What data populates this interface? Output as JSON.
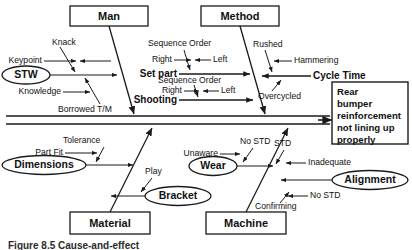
{
  "figure": {
    "type": "fishbone-ishikawa-cause-and-effect-diagram",
    "caption": "Figure 8.5  Cause-and-effect"
  },
  "effect": {
    "label": "Rear bumper reinforcement not lining up properly",
    "lines": [
      "Rear",
      "bumper",
      "reinforcement",
      "not lining up",
      "properly"
    ]
  },
  "categories": [
    {
      "id": "man",
      "label": "Man",
      "position": "top-left"
    },
    {
      "id": "method",
      "label": "Method",
      "position": "top-right"
    },
    {
      "id": "material",
      "label": "Material",
      "position": "bottom-left"
    },
    {
      "id": "machine",
      "label": "Machine",
      "position": "bottom-right"
    }
  ],
  "ovals": [
    {
      "id": "stw",
      "label": "STW"
    },
    {
      "id": "dimensions",
      "label": "Dimensions"
    },
    {
      "id": "bracket",
      "label": "Bracket"
    },
    {
      "id": "wear",
      "label": "Wear"
    },
    {
      "id": "alignment",
      "label": "Alignment"
    }
  ],
  "branches": {
    "man": {
      "name": "Man",
      "causes": [
        {
          "label": "Knack",
          "kind": "minor"
        },
        {
          "label": "Keypoint",
          "kind": "minor"
        },
        {
          "label": "STW",
          "kind": "oval"
        },
        {
          "label": "Knowledge",
          "kind": "minor"
        },
        {
          "label": "Borrowed T/M",
          "kind": "minor"
        }
      ]
    },
    "method": {
      "name": "Method",
      "majors": [
        {
          "label": "Set part",
          "causes": [
            "Sequence Order",
            "Right",
            "Left"
          ]
        },
        {
          "label": "Shooting",
          "causes": [
            "Sequence Order",
            "Right",
            "Left"
          ]
        },
        {
          "label": "Cycle Time",
          "causes": [
            "Rushed",
            "Hammering",
            "Overcycled"
          ]
        }
      ]
    },
    "material": {
      "name": "Material",
      "causes": [
        {
          "label": "Tolerance",
          "kind": "minor"
        },
        {
          "label": "Part Fit",
          "kind": "minor"
        },
        {
          "label": "Dimensions",
          "kind": "oval"
        },
        {
          "label": "Play",
          "kind": "minor"
        },
        {
          "label": "Bracket",
          "kind": "oval"
        }
      ]
    },
    "machine": {
      "name": "Machine",
      "causes": [
        {
          "label": "No STD",
          "kind": "minor"
        },
        {
          "label": "Unaware",
          "kind": "minor"
        },
        {
          "label": "Wear",
          "kind": "oval"
        },
        {
          "label": "STD",
          "kind": "minor"
        },
        {
          "label": "Inadequate",
          "kind": "minor"
        },
        {
          "label": "Alignment",
          "kind": "oval"
        },
        {
          "label": "No STD",
          "kind": "minor"
        },
        {
          "label": "Confirming",
          "kind": "minor"
        }
      ]
    }
  },
  "labels": {
    "man": "Man",
    "method": "Method",
    "material": "Material",
    "machine": "Machine",
    "knack": "Knack",
    "keypoint": "Keypoint",
    "stw": "STW",
    "knowledge": "Knowledge",
    "borrowed_tm": "Borrowed T/M",
    "sequence_order_1": "Sequence Order",
    "right_1": "Right",
    "left_1": "Left",
    "set_part": "Set part",
    "sequence_order_2": "Sequence Order",
    "right_2": "Right",
    "left_2": "Left",
    "shooting": "Shooting",
    "rushed": "Rushed",
    "hammering": "Hammering",
    "cycle_time": "Cycle Time",
    "overcycled": "Overcycled",
    "tolerance": "Tolerance",
    "part_fit": "Part Fit",
    "dimensions": "Dimensions",
    "play": "Play",
    "bracket": "Bracket",
    "no_std_1": "No STD",
    "unaware": "Unaware",
    "wear": "Wear",
    "std": "STD",
    "inadequate": "Inadequate",
    "alignment": "Alignment",
    "no_std_2": "No STD",
    "confirming": "Confirming",
    "effect_l1": "Rear",
    "effect_l2": "bumper",
    "effect_l3": "reinforcement",
    "effect_l4": "not lining up",
    "effect_l5": "properly",
    "caption": "Figure 8.5  Cause-and-effect"
  },
  "colors": {
    "ink": "#1a1a1a",
    "paper": "#ffffff",
    "caption": "#2b2b2b"
  }
}
